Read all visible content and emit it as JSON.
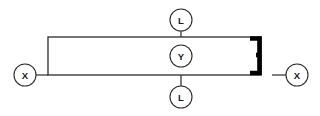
{
  "diagram": {
    "type": "engineering-dimension-callout",
    "background_color": "#ffffff",
    "line_color": "#2b2b2b",
    "accent_color": "#000000",
    "part": {
      "shape": "rectangular-bar",
      "x": 48,
      "y": 37,
      "width": 213,
      "height": 38
    },
    "bracket": {
      "shape": "right-end-bracket",
      "description": "thick black bracket at right end of bar"
    },
    "balloons": [
      {
        "id": "balloon-x-left",
        "label": "X",
        "cx": 25,
        "cy": 75,
        "r": 11
      },
      {
        "id": "balloon-l-top",
        "label": "L",
        "cx": 181,
        "cy": 20,
        "r": 11
      },
      {
        "id": "balloon-y-mid",
        "label": "Y",
        "cx": 181,
        "cy": 56,
        "r": 11
      },
      {
        "id": "balloon-l-bottom",
        "label": "L",
        "cx": 181,
        "cy": 97,
        "r": 11
      },
      {
        "id": "balloon-x-right",
        "label": "X",
        "cx": 297,
        "cy": 75,
        "r": 11
      }
    ]
  }
}
